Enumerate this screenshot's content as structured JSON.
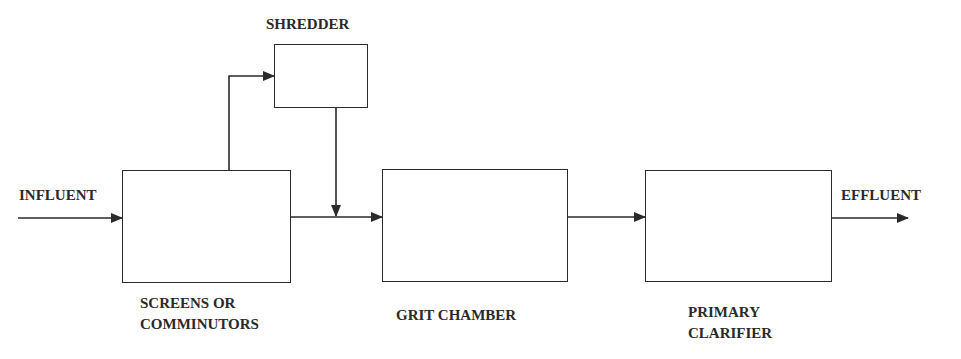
{
  "diagram": {
    "type": "process-flow",
    "nodes": {
      "shredder": {
        "label": "SHREDDER"
      },
      "screens": {
        "label_line1": "SCREENS OR",
        "label_line2": "COMMINUTORS"
      },
      "grit": {
        "label": "GRIT CHAMBER"
      },
      "clarifier": {
        "label_line1": "PRIMARY",
        "label_line2": "CLARIFIER"
      }
    },
    "io": {
      "input": "INFLUENT",
      "output": "EFFLUENT"
    },
    "edges": [
      [
        "INFLUENT",
        "SCREENS OR COMMINUTORS"
      ],
      [
        "SCREENS OR COMMINUTORS",
        "SHREDDER"
      ],
      [
        "SHREDDER",
        "GRIT CHAMBER"
      ],
      [
        "SCREENS OR COMMINUTORS",
        "GRIT CHAMBER"
      ],
      [
        "GRIT CHAMBER",
        "PRIMARY CLARIFIER"
      ],
      [
        "PRIMARY CLARIFIER",
        "EFFLUENT"
      ]
    ],
    "line_color": "#2a2a2a"
  }
}
